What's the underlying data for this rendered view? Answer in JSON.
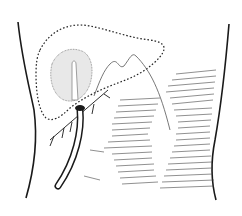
{
  "figure": {
    "colors": {
      "background": "#ffffff",
      "ink": "#1a1a1a",
      "stipple": "#555555",
      "hatch": "#444444"
    },
    "elements": [
      {
        "name": "body-outline-left"
      },
      {
        "name": "body-outline-right"
      },
      {
        "name": "liver-dotted-outline"
      },
      {
        "name": "gallbladder"
      },
      {
        "name": "drainage-tube"
      },
      {
        "name": "sutures"
      },
      {
        "name": "hatched-tissue"
      }
    ]
  }
}
